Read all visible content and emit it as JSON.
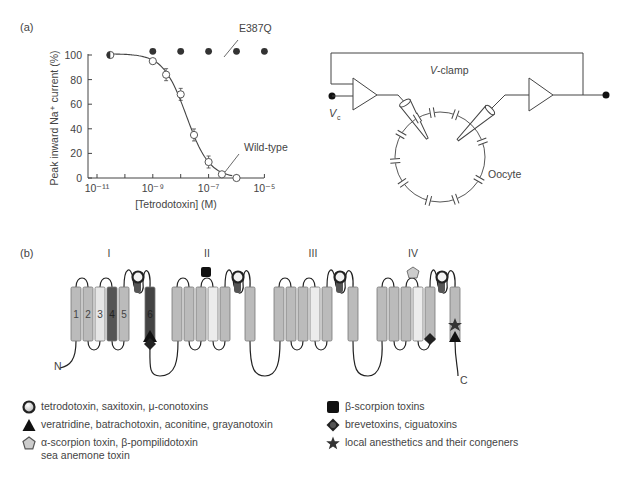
{
  "panel_a": {
    "label": "(a)",
    "chart": {
      "ylabel": "Peak inward Na⁺ current (%)",
      "xlabel": "[Tetrodotoxin] (M)",
      "y_ticks": [
        "0",
        "20",
        "40",
        "60",
        "80",
        "100"
      ],
      "x_ticks": [
        "10⁻¹¹",
        "10⁻⁹",
        "10⁻⁷",
        "10⁻⁵"
      ],
      "annotation_mutant": "E387Q",
      "annotation_wt": "Wild-type"
    },
    "circuit": {
      "vclamp_label": "V-clamp",
      "vc_label": "V",
      "vc_sub": "c",
      "oocyte_label": "Oocyte"
    }
  },
  "panel_b": {
    "label": "(b)",
    "domains": [
      "I",
      "II",
      "III",
      "IV"
    ],
    "segment_labels": [
      "1",
      "2",
      "3",
      "4",
      "5",
      "6"
    ],
    "n_label": "N",
    "c_label": "C",
    "legend": [
      {
        "symbol": "circle-ring",
        "text": "tetrodotoxin, saxitoxin, μ-conotoxins"
      },
      {
        "symbol": "triangle",
        "text": "veratridine, batrachotoxin, aconitine, grayanotoxin"
      },
      {
        "symbol": "pentagon",
        "text": "α-scorpion toxin, β-pompilidotoxin",
        "text2": "sea anemone toxin"
      },
      {
        "symbol": "square",
        "text": "β-scorpion toxins"
      },
      {
        "symbol": "diamond",
        "text": "brevetoxins, ciguatoxins"
      },
      {
        "symbol": "star",
        "text": "local anesthetics and their congeners"
      }
    ]
  },
  "chart_data": {
    "type": "scatter",
    "title": "",
    "xlabel": "[Tetrodotoxin] (M)",
    "ylabel": "Peak inward Na+ current (%)",
    "x_scale": "log",
    "xlim": [
      1e-11,
      1e-05
    ],
    "ylim": [
      0,
      100
    ],
    "x_tick_labels": [
      "10^-11",
      "10^-9",
      "10^-7",
      "10^-5"
    ],
    "y_tick_labels": [
      "0",
      "20",
      "40",
      "60",
      "80",
      "100"
    ],
    "grid": false,
    "series": [
      {
        "name": "Wild-type",
        "marker": "open-circle",
        "fit_curve": true,
        "x": [
          3e-11,
          1e-09,
          3e-09,
          1e-08,
          3e-08,
          1e-07,
          3e-07,
          1e-06
        ],
        "y": [
          100,
          95,
          84,
          68,
          35,
          13,
          3,
          0
        ]
      },
      {
        "name": "E387Q",
        "marker": "filled-circle",
        "fit_curve": false,
        "x": [
          3e-11,
          1e-09,
          1e-08,
          1e-07,
          1e-06,
          1e-05
        ],
        "y": [
          100,
          103,
          103,
          103,
          103,
          103
        ]
      }
    ]
  }
}
